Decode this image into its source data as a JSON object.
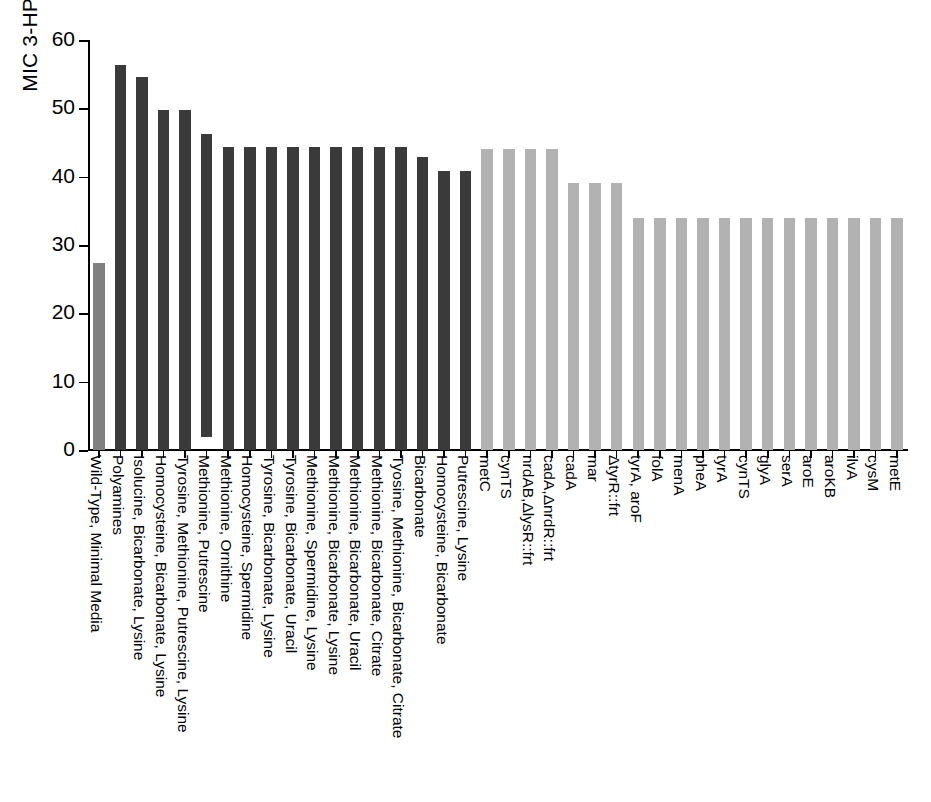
{
  "chart_data": {
    "type": "bar",
    "title": "",
    "subtitle": "",
    "xlabel": "",
    "ylabel": "MIC 3-HP (g/L)",
    "ylim": [
      0,
      60
    ],
    "yticks": [
      0,
      10,
      20,
      30,
      40,
      50,
      60
    ],
    "ytick_labels": [
      "0",
      "10",
      "20",
      "30",
      "40",
      "50",
      "60"
    ],
    "grid": false,
    "legend": "none",
    "colors": {
      "wild_type": "#808080",
      "evolved_medium": "#3a3a3a",
      "mutant_strain": "#b2b2b2",
      "axis": "#000000",
      "background": "#ffffff"
    },
    "categories": [
      "Wild-Type, Minimal Media",
      "Polyamines",
      "Isolucine, Bicarbonate, Lysine",
      "Homocysteine, Bicarbonate, Lysine",
      "Tyrosine, Methionine, Putrescine, Lysine",
      "Methionine, Putrescine",
      "Methionine, Ornithine",
      "Homocysteine, Spermidine",
      "Tyrosine, Bicarbonate, Lysine",
      "Tyrosine, Bicarbonate, Uracil",
      "Methionine, Spermidine, Lysine",
      "Methionine, Bicarbonate, Lysine",
      "Methionine, Bicarbonate, Uracil",
      "Methionine, Bicarbonate, Citrate",
      "Tyosine, Methionine, Bicarbonate, Citrate",
      "Bicarbonate",
      "Homocysteine, Bicarbonate",
      "Putrescine, Lysine",
      "metC",
      "cynTS",
      "nrdAB,ΔlysR::frt",
      "cadA,ΔnrdR::frt",
      "cadA",
      "mar",
      "ΔtyrR::frt",
      "tyrA, aroF",
      "folA",
      "menA",
      "pheA",
      "tyrA",
      "cynTS",
      "glyA",
      "serA",
      "aroE",
      "aroKB",
      "ilvA",
      "cysM",
      "metE"
    ],
    "values": [
      27.4,
      56.3,
      54.6,
      49.7,
      49.7,
      46.3,
      44.4,
      44.4,
      44.4,
      44.4,
      44.4,
      44.4,
      44.4,
      44.4,
      44.4,
      42.9,
      40.8,
      40.8,
      44.1,
      44.1,
      44.1,
      44.1,
      39.1,
      39.1,
      39.1,
      34.0,
      34.0,
      34.0,
      34.0,
      34.0,
      34.0,
      34.0,
      34.0,
      34.0,
      34.0,
      34.0,
      34.0,
      34.0
    ],
    "bar_bases": [
      0,
      0,
      0,
      0,
      0,
      1.9,
      0,
      0,
      0,
      0,
      0,
      0,
      0,
      0,
      0,
      0,
      0,
      0,
      0,
      0,
      0,
      0,
      0,
      0,
      0,
      0,
      0,
      0,
      0,
      0,
      0,
      0,
      0,
      0,
      0,
      0,
      0,
      0
    ],
    "series_groups": [
      {
        "name": "Wild-Type",
        "color": "#808080",
        "indices": [
          0
        ]
      },
      {
        "name": "Adapted media conditions",
        "color": "#3a3a3a",
        "indices": [
          1,
          2,
          3,
          4,
          5,
          6,
          7,
          8,
          9,
          10,
          11,
          12,
          13,
          14,
          15,
          16,
          17
        ]
      },
      {
        "name": "Mutant strains",
        "color": "#b2b2b2",
        "indices": [
          18,
          19,
          20,
          21,
          22,
          23,
          24,
          25,
          26,
          27,
          28,
          29,
          30,
          31,
          32,
          33,
          34,
          35,
          36,
          37
        ]
      }
    ]
  }
}
